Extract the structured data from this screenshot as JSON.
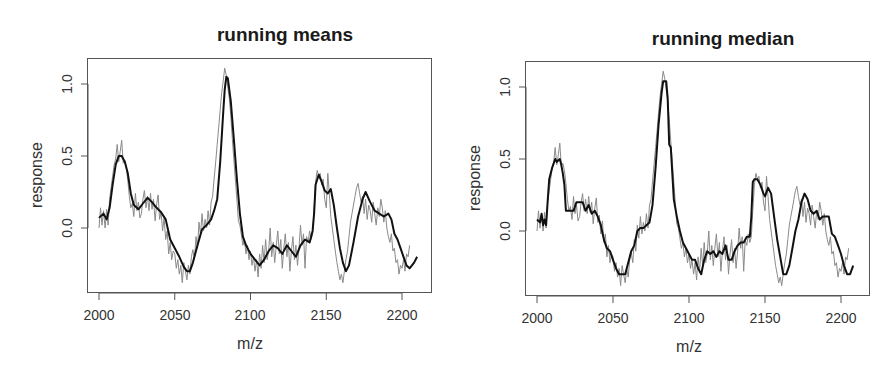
{
  "chart_data": [
    {
      "type": "line",
      "title": "running means",
      "xlabel": "m/z",
      "ylabel": "response",
      "xlim": [
        1992,
        2222
      ],
      "ylim": [
        -0.45,
        1.2
      ],
      "xticks": [
        2000,
        2050,
        2100,
        2150,
        2200
      ],
      "xtick_labels": [
        "2000",
        "2050",
        "2100",
        "2150",
        "2200"
      ],
      "yticks": [
        0.0,
        0.5,
        1.0
      ],
      "ytick_labels": [
        "0.0",
        "0.5",
        "1.0"
      ],
      "grid": false,
      "legend": null,
      "series": [
        {
          "name": "raw spectrum",
          "color": "#8a8a8a",
          "width": 1,
          "x": [
            2000,
            2001,
            2002,
            2003,
            2004,
            2005,
            2006,
            2007,
            2008,
            2009,
            2010,
            2011,
            2012,
            2013,
            2014,
            2015,
            2016,
            2017,
            2018,
            2019,
            2020,
            2021,
            2022,
            2023,
            2024,
            2025,
            2026,
            2027,
            2028,
            2029,
            2030,
            2031,
            2032,
            2033,
            2034,
            2035,
            2036,
            2037,
            2038,
            2039,
            2040,
            2041,
            2042,
            2043,
            2044,
            2045,
            2046,
            2047,
            2048,
            2049,
            2050,
            2051,
            2052,
            2053,
            2054,
            2055,
            2056,
            2057,
            2058,
            2059,
            2060,
            2061,
            2062,
            2063,
            2064,
            2065,
            2066,
            2067,
            2068,
            2069,
            2070,
            2071,
            2072,
            2073,
            2074,
            2075,
            2076,
            2077,
            2078,
            2079,
            2080,
            2081,
            2082,
            2083,
            2084,
            2085,
            2086,
            2087,
            2088,
            2089,
            2090,
            2091,
            2092,
            2093,
            2094,
            2095,
            2096,
            2097,
            2098,
            2099,
            2100,
            2101,
            2102,
            2103,
            2104,
            2105,
            2106,
            2107,
            2108,
            2109,
            2110,
            2111,
            2112,
            2113,
            2114,
            2115,
            2116,
            2117,
            2118,
            2119,
            2120,
            2121,
            2122,
            2123,
            2124,
            2125,
            2126,
            2127,
            2128,
            2129,
            2130,
            2131,
            2132,
            2133,
            2134,
            2135,
            2136,
            2137,
            2138,
            2139,
            2140,
            2141,
            2142,
            2143,
            2144,
            2145,
            2146,
            2147,
            2148,
            2149,
            2150,
            2151,
            2152,
            2153,
            2154,
            2155,
            2156,
            2157,
            2158,
            2159,
            2160,
            2161,
            2162,
            2163,
            2164,
            2165,
            2166,
            2167,
            2168,
            2169,
            2170,
            2171,
            2172,
            2173,
            2174,
            2175,
            2176,
            2177,
            2178,
            2179,
            2180,
            2181,
            2182,
            2183,
            2184,
            2185,
            2186,
            2187,
            2188,
            2189,
            2190,
            2191,
            2192,
            2193,
            2194,
            2195,
            2196,
            2197,
            2198,
            2199,
            2200,
            2201,
            2202,
            2203,
            2204,
            2205,
            2206,
            2207,
            2208,
            2209,
            2210
          ],
          "y": [
            0.0,
            0.14,
            0.02,
            0.12,
            0.0,
            0.13,
            0.02,
            0.2,
            0.28,
            0.36,
            0.44,
            0.48,
            0.58,
            0.46,
            0.53,
            0.61,
            0.45,
            0.47,
            0.42,
            0.33,
            0.22,
            0.14,
            0.17,
            0.08,
            0.24,
            0.12,
            0.18,
            0.07,
            0.1,
            0.2,
            0.26,
            0.14,
            0.22,
            0.12,
            0.24,
            0.13,
            0.2,
            0.05,
            0.16,
            0.23,
            0.06,
            0.11,
            -0.02,
            0.07,
            -0.08,
            -0.02,
            -0.18,
            -0.1,
            -0.22,
            -0.16,
            -0.18,
            -0.28,
            -0.22,
            -0.32,
            -0.26,
            -0.38,
            -0.24,
            -0.3,
            -0.36,
            -0.26,
            -0.32,
            -0.2,
            -0.15,
            -0.22,
            -0.06,
            -0.14,
            0.04,
            -0.05,
            0.1,
            -0.02,
            0.06,
            0.0,
            0.12,
            0.02,
            0.18,
            0.22,
            0.34,
            0.46,
            0.58,
            0.7,
            0.82,
            0.94,
            1.02,
            1.11,
            1.06,
            0.98,
            0.9,
            0.78,
            0.62,
            0.48,
            0.34,
            0.2,
            0.05,
            0.02,
            -0.05,
            -0.12,
            -0.08,
            -0.18,
            -0.12,
            -0.22,
            -0.16,
            -0.26,
            -0.2,
            -0.3,
            -0.22,
            -0.34,
            -0.18,
            -0.28,
            -0.12,
            -0.24,
            -0.08,
            -0.22,
            -0.16,
            0.0,
            -0.2,
            -0.1,
            -0.24,
            -0.12,
            -0.02,
            -0.18,
            -0.08,
            -0.28,
            -0.14,
            -0.04,
            -0.2,
            -0.1,
            -0.3,
            -0.16,
            -0.06,
            -0.22,
            -0.12,
            -0.26,
            -0.14,
            0.02,
            -0.12,
            -0.04,
            -0.28,
            -0.06,
            -0.1,
            -0.02,
            -0.08,
            -0.04,
            0.14,
            0.32,
            0.4,
            0.36,
            0.38,
            0.3,
            0.34,
            0.2,
            0.14,
            0.38,
            0.24,
            0.08,
            0.0,
            -0.08,
            -0.16,
            -0.24,
            -0.3,
            -0.36,
            -0.32,
            -0.38,
            -0.3,
            -0.22,
            -0.16,
            -0.06,
            0.04,
            0.1,
            0.16,
            0.22,
            0.28,
            0.31,
            0.24,
            0.18,
            0.22,
            0.1,
            0.2,
            0.06,
            0.16,
            0.12,
            0.04,
            0.18,
            0.1,
            0.02,
            0.14,
            0.08,
            0.2,
            0.14,
            0.04,
            0.12,
            0.0,
            -0.06,
            -0.1,
            -0.04,
            -0.16,
            -0.14,
            -0.24,
            -0.22,
            -0.32,
            -0.26,
            -0.28,
            -0.22,
            -0.3,
            -0.18,
            -0.2,
            -0.12
          ]
        },
        {
          "name": "running mean",
          "color": "#111111",
          "width": 2,
          "x": [
            2000,
            2003,
            2005,
            2007,
            2009,
            2011,
            2013,
            2015,
            2017,
            2019,
            2021,
            2023,
            2026,
            2029,
            2032,
            2035,
            2038,
            2041,
            2044,
            2047,
            2050,
            2053,
            2056,
            2058,
            2060,
            2062,
            2065,
            2068,
            2071,
            2074,
            2076,
            2078,
            2080,
            2082,
            2083,
            2084,
            2085,
            2087,
            2089,
            2091,
            2093,
            2095,
            2097,
            2100,
            2103,
            2106,
            2109,
            2112,
            2115,
            2118,
            2121,
            2124,
            2127,
            2130,
            2133,
            2136,
            2139,
            2141,
            2142,
            2143,
            2145,
            2147,
            2149,
            2151,
            2153,
            2155,
            2157,
            2159,
            2161,
            2163,
            2165,
            2168,
            2171,
            2174,
            2176,
            2179,
            2182,
            2185,
            2188,
            2191,
            2193,
            2195,
            2197,
            2199,
            2201,
            2203,
            2205,
            2208,
            2210
          ],
          "y": [
            0.07,
            0.1,
            0.06,
            0.14,
            0.3,
            0.44,
            0.5,
            0.5,
            0.46,
            0.38,
            0.24,
            0.16,
            0.13,
            0.17,
            0.21,
            0.18,
            0.14,
            0.11,
            0.06,
            -0.08,
            -0.14,
            -0.2,
            -0.27,
            -0.3,
            -0.3,
            -0.24,
            -0.12,
            -0.01,
            0.02,
            0.06,
            0.12,
            0.2,
            0.46,
            0.8,
            0.96,
            1.05,
            1.04,
            0.88,
            0.62,
            0.34,
            0.1,
            -0.06,
            -0.12,
            -0.18,
            -0.22,
            -0.26,
            -0.22,
            -0.16,
            -0.12,
            -0.14,
            -0.18,
            -0.12,
            -0.16,
            -0.2,
            -0.12,
            -0.08,
            -0.1,
            -0.02,
            0.1,
            0.3,
            0.37,
            0.32,
            0.26,
            0.24,
            0.27,
            0.16,
            0.0,
            -0.14,
            -0.24,
            -0.3,
            -0.26,
            -0.1,
            0.08,
            0.2,
            0.25,
            0.18,
            0.12,
            0.1,
            0.08,
            0.1,
            0.06,
            -0.04,
            -0.08,
            -0.14,
            -0.2,
            -0.26,
            -0.28,
            -0.24,
            -0.2
          ]
        }
      ]
    },
    {
      "type": "line",
      "title": "running median",
      "xlabel": "m/z",
      "ylabel": "response",
      "xlim": [
        1992,
        2222
      ],
      "ylim": [
        -0.45,
        1.2
      ],
      "xticks": [
        2000,
        2050,
        2100,
        2150,
        2200
      ],
      "xtick_labels": [
        "2000",
        "2050",
        "2100",
        "2150",
        "2200"
      ],
      "yticks": [
        0.0,
        0.5,
        1.0
      ],
      "ytick_labels": [
        "0.0",
        "0.5",
        "1.0"
      ],
      "grid": false,
      "legend": null,
      "series": [
        {
          "name": "raw spectrum",
          "color": "#8a8a8a",
          "width": 1,
          "source": "same raw spectrum as running means panel"
        },
        {
          "name": "running median",
          "color": "#111111",
          "width": 2,
          "x": [
            2000,
            2002,
            2003,
            2004,
            2005,
            2006,
            2007,
            2008,
            2010,
            2012,
            2013,
            2015,
            2016,
            2017,
            2018,
            2019,
            2020,
            2022,
            2024,
            2026,
            2027,
            2028,
            2030,
            2032,
            2034,
            2036,
            2038,
            2040,
            2042,
            2044,
            2046,
            2048,
            2050,
            2052,
            2054,
            2056,
            2058,
            2060,
            2062,
            2064,
            2066,
            2068,
            2070,
            2072,
            2074,
            2076,
            2078,
            2080,
            2082,
            2083,
            2084,
            2085,
            2086,
            2087,
            2088,
            2089,
            2090,
            2092,
            2094,
            2096,
            2098,
            2100,
            2102,
            2104,
            2106,
            2108,
            2110,
            2112,
            2114,
            2116,
            2118,
            2120,
            2122,
            2124,
            2126,
            2128,
            2130,
            2132,
            2134,
            2136,
            2138,
            2140,
            2141,
            2142,
            2143,
            2145,
            2147,
            2149,
            2150,
            2152,
            2154,
            2156,
            2158,
            2160,
            2162,
            2164,
            2166,
            2168,
            2170,
            2172,
            2174,
            2176,
            2178,
            2180,
            2182,
            2184,
            2186,
            2188,
            2190,
            2192,
            2194,
            2196,
            2198,
            2200,
            2202,
            2204,
            2206,
            2208
          ],
          "y": [
            0.08,
            0.06,
            0.12,
            0.04,
            0.08,
            0.04,
            0.2,
            0.36,
            0.44,
            0.5,
            0.48,
            0.5,
            0.46,
            0.4,
            0.32,
            0.14,
            0.14,
            0.14,
            0.14,
            0.2,
            0.2,
            0.2,
            0.2,
            0.14,
            0.18,
            0.12,
            0.14,
            0.1,
            0.04,
            -0.06,
            -0.12,
            -0.14,
            -0.2,
            -0.26,
            -0.3,
            -0.3,
            -0.3,
            -0.22,
            -0.14,
            -0.1,
            0.0,
            0.02,
            0.02,
            0.04,
            0.06,
            0.18,
            0.44,
            0.74,
            0.96,
            1.04,
            1.04,
            1.04,
            0.92,
            0.6,
            0.58,
            0.4,
            0.22,
            0.1,
            0.0,
            -0.08,
            -0.12,
            -0.16,
            -0.2,
            -0.2,
            -0.26,
            -0.3,
            -0.2,
            -0.14,
            -0.16,
            -0.14,
            -0.18,
            -0.14,
            -0.16,
            -0.1,
            -0.2,
            -0.2,
            -0.14,
            -0.1,
            -0.08,
            -0.08,
            -0.04,
            -0.04,
            0.1,
            0.34,
            0.36,
            0.36,
            0.32,
            0.26,
            0.24,
            0.3,
            0.26,
            0.1,
            -0.06,
            -0.18,
            -0.3,
            -0.3,
            -0.24,
            -0.12,
            0.0,
            0.08,
            0.2,
            0.26,
            0.22,
            0.14,
            0.12,
            0.14,
            0.08,
            0.1,
            0.1,
            0.1,
            -0.02,
            -0.04,
            -0.1,
            -0.16,
            -0.24,
            -0.3,
            -0.3,
            -0.24,
            -0.24
          ]
        }
      ]
    }
  ],
  "panels": [
    {
      "title": "running means",
      "xlabel": "m/z",
      "ylabel": "response",
      "xtick_labels": [
        "2000",
        "2050",
        "2100",
        "2150",
        "2200"
      ],
      "ytick_labels": [
        "0.0",
        "0.5",
        "1.0"
      ]
    },
    {
      "title": "running median",
      "xlabel": "m/z",
      "ylabel": "response",
      "xtick_labels": [
        "2000",
        "2050",
        "2100",
        "2150",
        "2200"
      ],
      "ytick_labels": [
        "0.0",
        "0.5",
        "1.0"
      ]
    }
  ],
  "colors": {
    "raw_line": "#8a8a8a",
    "smooth_line": "#111111",
    "axis": "#555555"
  }
}
